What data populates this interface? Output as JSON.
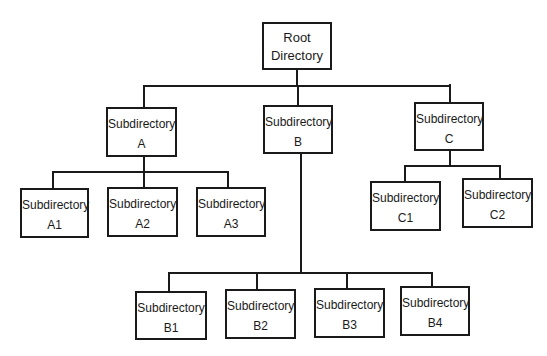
{
  "diagram": {
    "type": "tree",
    "root": {
      "line1": "Root",
      "line2": "Directory"
    },
    "nodes": {
      "A": {
        "line1": "Subdirectory",
        "line2": "A"
      },
      "B": {
        "line1": "Subdirectory",
        "line2": "B"
      },
      "C": {
        "line1": "Subdirectory",
        "line2": "C"
      },
      "A1": {
        "line1": "Subdirectory",
        "line2": "A1"
      },
      "A2": {
        "line1": "Subdirectory",
        "line2": "A2"
      },
      "A3": {
        "line1": "Subdirectory",
        "line2": "A3"
      },
      "B1": {
        "line1": "Subdirectory",
        "line2": "B1"
      },
      "B2": {
        "line1": "Subdirectory",
        "line2": "B2"
      },
      "B3": {
        "line1": "Subdirectory",
        "line2": "B3"
      },
      "B4": {
        "line1": "Subdirectory",
        "line2": "B4"
      },
      "C1": {
        "line1": "Subdirectory",
        "line2": "C1"
      },
      "C2": {
        "line1": "Subdirectory",
        "line2": "C2"
      }
    },
    "edges": [
      [
        "Root Directory",
        "Subdirectory A"
      ],
      [
        "Root Directory",
        "Subdirectory B"
      ],
      [
        "Root Directory",
        "Subdirectory C"
      ],
      [
        "Subdirectory A",
        "Subdirectory A1"
      ],
      [
        "Subdirectory A",
        "Subdirectory A2"
      ],
      [
        "Subdirectory A",
        "Subdirectory A3"
      ],
      [
        "Subdirectory B",
        "Subdirectory B1"
      ],
      [
        "Subdirectory B",
        "Subdirectory B2"
      ],
      [
        "Subdirectory B",
        "Subdirectory B3"
      ],
      [
        "Subdirectory B",
        "Subdirectory B4"
      ],
      [
        "Subdirectory C",
        "Subdirectory C1"
      ],
      [
        "Subdirectory C",
        "Subdirectory C2"
      ]
    ]
  }
}
